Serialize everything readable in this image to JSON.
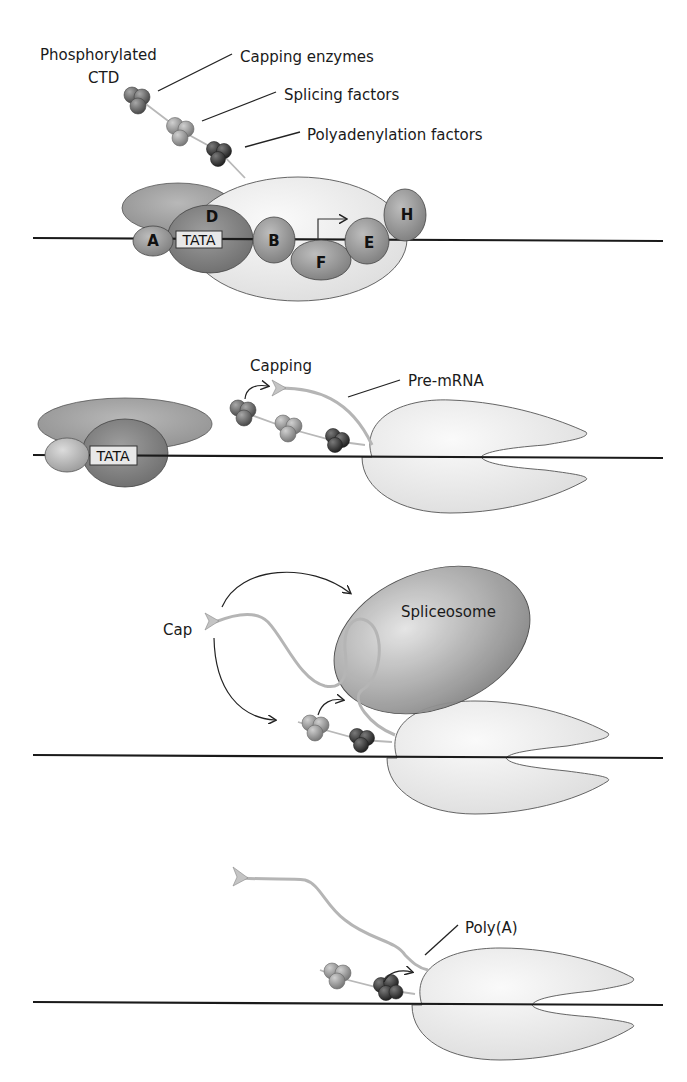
{
  "figure": {
    "panels": [
      {
        "id": "initiation",
        "labels": {
          "ctd": [
            "Phosphorylated",
            "CTD"
          ],
          "capping_enzymes": "Capping enzymes",
          "splicing_factors": "Splicing factors",
          "polyadenylation_factors": "Polyadenylation factors"
        },
        "transcription_factors": [
          "A",
          "D",
          "B",
          "F",
          "E",
          "H"
        ],
        "promoter": "TATA"
      },
      {
        "id": "capping",
        "labels": {
          "step": "Capping",
          "transcript": "Pre-mRNA"
        },
        "promoter": "TATA"
      },
      {
        "id": "splicing",
        "labels": {
          "cap": "Cap",
          "complex": "Spliceosome"
        }
      },
      {
        "id": "polyadenylation",
        "labels": {
          "tail": "Poly(A)"
        }
      }
    ],
    "colors": {
      "dna": "#1a1a1a",
      "rna": "#b5b5b5",
      "pol_ii": "#e6e6e6",
      "tf_dark": "#7a7a7a",
      "tf_medium": "#9a9a9a",
      "capping_cluster": "#6e6e6e",
      "splicing_cluster": "#9c9c9c",
      "polyA_cluster": "#3e3e3e",
      "spliceosome": "#8a8a8a"
    }
  }
}
